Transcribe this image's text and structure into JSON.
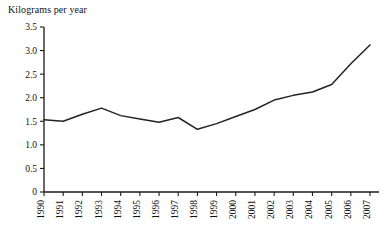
{
  "chart_data": {
    "type": "line",
    "title": "Kilograms per year",
    "xlabel": "",
    "ylabel": "Kilograms per year",
    "ylim": [
      0,
      3.5
    ],
    "ytick_labels": [
      "0",
      "0.5",
      "1.0",
      "1.5",
      "2.0",
      "2.5",
      "3.0",
      "3.5"
    ],
    "ytick_values": [
      0,
      0.5,
      1.0,
      1.5,
      2.0,
      2.5,
      3.0,
      3.5
    ],
    "grid": false,
    "legend": null,
    "categories": [
      "1990",
      "1991",
      "1992",
      "1993",
      "1994",
      "1995",
      "1996",
      "1997",
      "1998",
      "1999",
      "2000",
      "2001",
      "2002",
      "2003",
      "2004",
      "2005",
      "2006",
      "2007"
    ],
    "values": [
      1.53,
      1.5,
      1.65,
      1.78,
      1.62,
      1.55,
      1.48,
      1.58,
      1.33,
      1.45,
      1.6,
      1.75,
      1.95,
      2.05,
      2.12,
      2.28,
      2.72,
      3.12
    ],
    "series": [
      {
        "name": "Kilograms per year",
        "color": "#232323",
        "values": [
          1.53,
          1.5,
          1.65,
          1.78,
          1.62,
          1.55,
          1.48,
          1.58,
          1.33,
          1.45,
          1.6,
          1.75,
          1.95,
          2.05,
          2.12,
          2.28,
          2.72,
          3.12
        ]
      }
    ]
  },
  "colors": {
    "line": "#232323",
    "axis": "#1a1a1a",
    "text": "#111111",
    "background": "#ffffff"
  }
}
